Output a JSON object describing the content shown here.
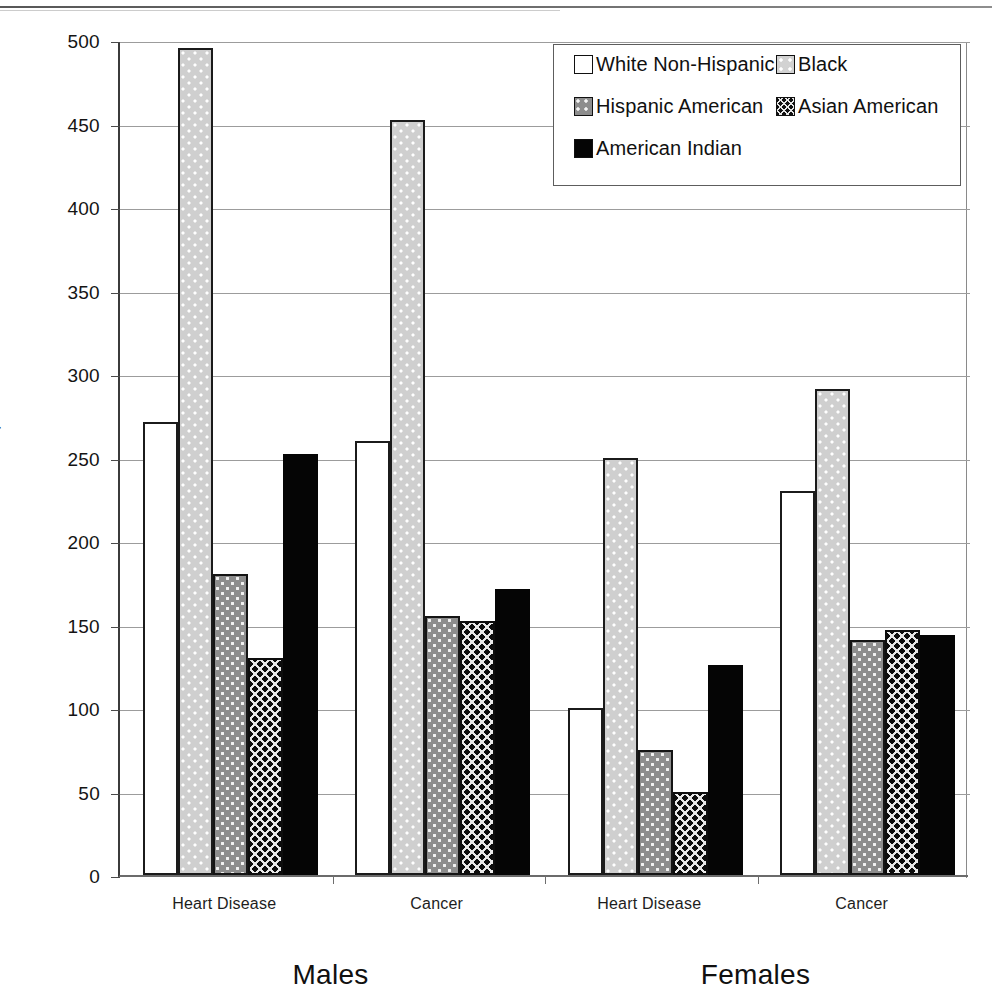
{
  "chart_data": {
    "type": "bar",
    "title": "",
    "xlabel": "",
    "ylabel": "Deaths Per 100,000 Persons",
    "ylim": [
      0,
      500
    ],
    "ytick_step": 50,
    "yticks": [
      "500",
      "450",
      "400",
      "350",
      "300",
      "250",
      "200",
      "150",
      "100",
      "50",
      "0"
    ],
    "grid": true,
    "legend_position": "top-right",
    "categories": [
      "Heart Disease",
      "Cancer",
      "Heart Disease",
      "Cancer"
    ],
    "group_labels": [
      "Males",
      "Females"
    ],
    "series": [
      {
        "name": "White Non-Hispanic",
        "style": "white",
        "values": [
          271,
          260,
          100,
          230
        ]
      },
      {
        "name": "Black",
        "style": "black",
        "values": [
          495,
          452,
          250,
          291
        ]
      },
      {
        "name": "Hispanic American",
        "style": "hisp",
        "values": [
          180,
          155,
          75,
          141
        ]
      },
      {
        "name": "Asian American",
        "style": "asian",
        "values": [
          130,
          152,
          50,
          147
        ]
      },
      {
        "name": "American Indian",
        "style": "ai",
        "values": [
          252,
          171,
          126,
          144
        ]
      }
    ]
  },
  "legend": {
    "items": [
      {
        "label": "White Non-Hispanic",
        "style": "white"
      },
      {
        "label": "Black",
        "style": "black"
      },
      {
        "label": "Hispanic American",
        "style": "hisp"
      },
      {
        "label": "Asian American",
        "style": "asian"
      },
      {
        "label": "American Indian",
        "style": "ai"
      }
    ]
  },
  "axis": {
    "y_title": "Deaths Per 100,000 Persons",
    "y_max": 500,
    "y_min": 0
  }
}
